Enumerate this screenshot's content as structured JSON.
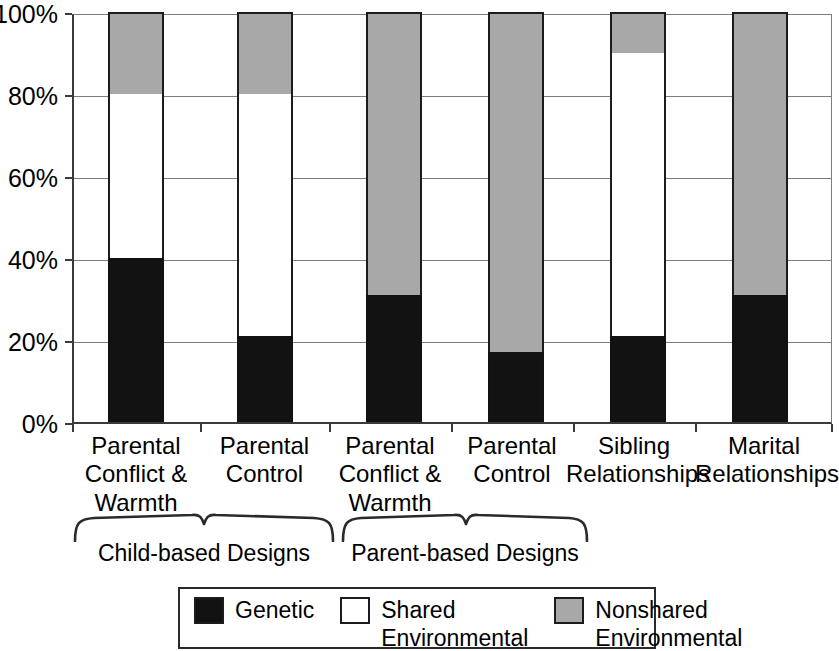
{
  "chart_data": {
    "type": "bar",
    "subtype": "stacked-100-percent",
    "title": "",
    "xlabel": "",
    "ylabel": "",
    "ylim": [
      0,
      100
    ],
    "ytick_labels": [
      "0%",
      "20%",
      "40%",
      "60%",
      "80%",
      "100%"
    ],
    "ytick_values": [
      0,
      20,
      40,
      60,
      80,
      100
    ],
    "grid": true,
    "legend_position": "bottom",
    "categories": [
      "Parental\nConflict &\nWarmth",
      "Parental\nControl",
      "Parental\nConflict &\nWarmth",
      "Parental\nControl",
      "Sibling\nRelationships",
      "Marital\nRelationships"
    ],
    "series": [
      {
        "name": "Genetic",
        "color": "#121212",
        "values": [
          40,
          21,
          31,
          17,
          21,
          31
        ]
      },
      {
        "name": "Shared Environmental",
        "color": "#ffffff",
        "values": [
          40,
          59,
          0,
          0,
          69,
          0
        ]
      },
      {
        "name": "Nonshared Environmental",
        "color": "#a8a8a8",
        "values": [
          20,
          20,
          69,
          83,
          10,
          69
        ]
      }
    ],
    "groups": [
      {
        "label": "Child-based Designs",
        "categories": [
          0,
          1
        ]
      },
      {
        "label": "Parent-based Designs",
        "categories": [
          2,
          3
        ]
      }
    ]
  },
  "legend": {
    "items": [
      {
        "label": "Genetic",
        "swatch": "genetic"
      },
      {
        "label": "Shared\nEnvironmental",
        "swatch": "shared"
      },
      {
        "label": "Nonshared\nEnvironmental",
        "swatch": "nonshared"
      }
    ]
  },
  "axis": {
    "ticks": [
      {
        "label": "100%",
        "value": 100
      },
      {
        "label": "80%",
        "value": 80
      },
      {
        "label": "60%",
        "value": 60
      },
      {
        "label": "40%",
        "value": 40
      },
      {
        "label": "20%",
        "value": 20
      },
      {
        "label": "0%",
        "value": 0
      }
    ]
  },
  "groups": {
    "items": [
      {
        "label": "Child-based Designs"
      },
      {
        "label": "Parent-based Designs"
      }
    ]
  }
}
